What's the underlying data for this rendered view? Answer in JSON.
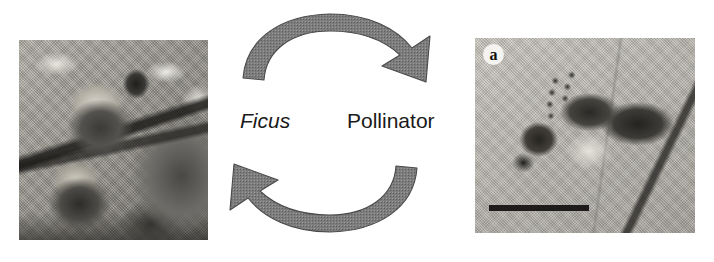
{
  "figure": {
    "background_color": "#ffffff",
    "width": 714,
    "height": 262,
    "type": "scientific-figure-mutualism-cycle"
  },
  "cycle": {
    "arrow_color": "#7d7d7d",
    "arrow_outline_color": "#4a4a4a",
    "labels": {
      "left": "Ficus",
      "left_style": "italic",
      "right": "Pollinator",
      "right_style": "normal"
    },
    "arrows": [
      {
        "name": "top-arrow",
        "direction": "clockwise",
        "from": "Ficus",
        "to": "Pollinator",
        "head_position": "right"
      },
      {
        "name": "bottom-arrow",
        "direction": "counter-clockwise",
        "from": "Pollinator",
        "to": "Ficus",
        "head_position": "left"
      }
    ]
  },
  "photos": {
    "left": {
      "name": "ficus-figs-photograph",
      "caption": "",
      "subject": "Ficus syconia (figs) on branch"
    },
    "right": {
      "name": "pollinator-wasp-photograph",
      "panel_letter": "a",
      "subject": "Fig-pollinating wasp, lateral view",
      "scale_bar_label": ""
    }
  }
}
